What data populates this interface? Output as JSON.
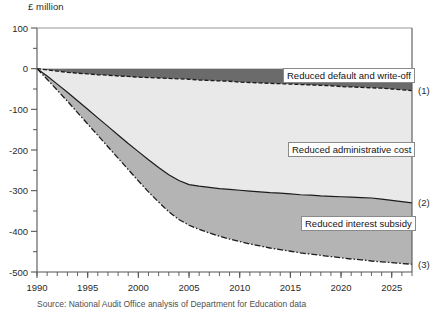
{
  "figure": {
    "y_axis_title": "£ million",
    "footnote": "Source: National Audit Office analysis of Department for Education data"
  },
  "chart_data": {
    "type": "area",
    "title": "",
    "subtitle": "",
    "xlabel": "",
    "ylabel": "£ million",
    "ylim": [
      -500,
      100
    ],
    "xlim": [
      1990,
      2027
    ],
    "grid": false,
    "legend_position": "inline-callouts",
    "yticks": [
      100,
      0,
      -100,
      -200,
      -300,
      -400,
      -500
    ],
    "ytick_labels": [
      "100",
      "0",
      "-100",
      "-200",
      "-300",
      "-400",
      "-500"
    ],
    "xticks": [
      1990,
      1995,
      2000,
      2005,
      2010,
      2015,
      2020,
      2025
    ],
    "xtick_labels": [
      "1990",
      "1995",
      "2000",
      "2005",
      "2010",
      "2015",
      "2020",
      "2025"
    ],
    "x": [
      1990,
      1991,
      1992,
      1993,
      1994,
      1995,
      1996,
      1997,
      1998,
      1999,
      2000,
      2001,
      2002,
      2003,
      2004,
      2005,
      2006,
      2007,
      2008,
      2009,
      2010,
      2011,
      2012,
      2013,
      2014,
      2015,
      2016,
      2017,
      2018,
      2019,
      2020,
      2021,
      2022,
      2023,
      2024,
      2025,
      2026,
      2027
    ],
    "series": [
      {
        "name": "Reduced default and write-off",
        "tag": "(1)",
        "fill_color": "#6b6b6b",
        "line_style": "dashed",
        "values": [
          0,
          -3,
          -6,
          -9,
          -11,
          -13,
          -15,
          -16,
          -18,
          -19,
          -21,
          -22,
          -23,
          -24,
          -25,
          -26,
          -28,
          -29,
          -30,
          -31,
          -33,
          -34,
          -35,
          -36,
          -37,
          -38,
          -39,
          -40,
          -41,
          -42,
          -44,
          -45,
          -46,
          -47,
          -48,
          -50,
          -52,
          -54
        ]
      },
      {
        "name": "Reduced administrative cost",
        "tag": "(2)",
        "fill_color": "#e9e9e9",
        "line_style": "solid",
        "values": [
          0,
          -18,
          -38,
          -58,
          -79,
          -100,
          -121,
          -142,
          -163,
          -184,
          -204,
          -224,
          -243,
          -261,
          -275,
          -285,
          -289,
          -292,
          -295,
          -297,
          -299,
          -301,
          -303,
          -305,
          -306,
          -308,
          -310,
          -311,
          -313,
          -314,
          -315,
          -316,
          -317,
          -318,
          -321,
          -324,
          -327,
          -330
        ]
      },
      {
        "name": "Reduced interest subsidy",
        "tag": "(3)",
        "fill_color": "#b4b4b4",
        "line_style": "dash-dot",
        "values": [
          0,
          -26,
          -53,
          -80,
          -108,
          -136,
          -164,
          -192,
          -220,
          -248,
          -276,
          -303,
          -328,
          -352,
          -371,
          -385,
          -395,
          -404,
          -412,
          -419,
          -425,
          -431,
          -436,
          -441,
          -445,
          -449,
          -453,
          -456,
          -459,
          -462,
          -465,
          -468,
          -470,
          -473,
          -475,
          -477,
          -479,
          -481
        ]
      }
    ],
    "callouts": [
      {
        "text": "Reduced default and write-off"
      },
      {
        "text": "Reduced administrative cost"
      },
      {
        "text": "Reduced interest subsidy"
      }
    ]
  }
}
